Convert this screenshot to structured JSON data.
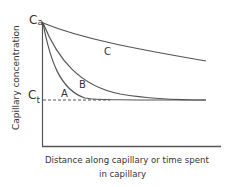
{
  "diagram": {
    "y_axis_label": "Capillary concentration",
    "x_axis_label_line1": "Distance along capillary or time spent",
    "x_axis_label_line2": "in capillary",
    "ca_label_main": "C",
    "ca_label_sub": "a",
    "ct_label_main": "C",
    "ct_label_sub": "t",
    "curves": [
      {
        "name": "A",
        "label": "A",
        "description": "rapid equilibration, reaches Ct early"
      },
      {
        "name": "B",
        "label": "B",
        "description": "slower equilibration, reaches Ct at end"
      },
      {
        "name": "C",
        "label": "C",
        "description": "slow decline, does not reach Ct"
      }
    ],
    "colors": {
      "line": "#555555",
      "text": "#333333",
      "background": "#ffffff"
    }
  }
}
